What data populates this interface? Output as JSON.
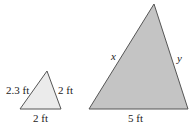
{
  "small_triangle": {
    "fill": "#ebebeb",
    "stroke": "#555555",
    "left_side": "2.3 ft",
    "right_side": "2 ft",
    "base": "2 ft"
  },
  "large_triangle": {
    "fill": "#c4c4c4",
    "stroke": "#555555",
    "left_side": "x",
    "right_side": "y",
    "base": "5 ft"
  }
}
